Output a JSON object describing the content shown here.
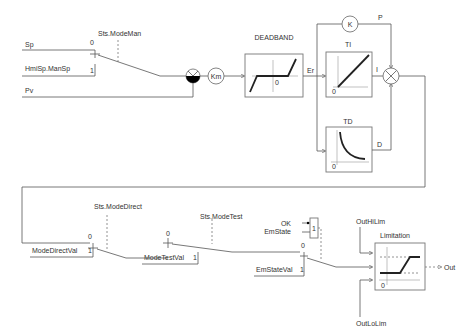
{
  "diagram": {
    "type": "PID controller block diagram",
    "inputs": {
      "sp": "Sp",
      "hmi_man_sp": "HmiSp.ManSp",
      "pv": "Pv"
    },
    "switches": {
      "mode_man": {
        "label": "Sts.ModeMan",
        "pos0": "0",
        "pos1": "1"
      },
      "mode_direct": {
        "label": "Sts.ModeDirect",
        "pos0": "0",
        "pos1": "1",
        "input1": "ModeDirectVal"
      },
      "mode_test": {
        "label": "Sts.ModeTest",
        "pos0": "0",
        "pos1": "1",
        "input1": "ModeTestVal"
      },
      "em_state": {
        "pos0": "0",
        "pos1": "1",
        "input1": "EmStateVal"
      }
    },
    "em_logic": {
      "ok": "OK",
      "em_state": "EmState",
      "value": "1"
    },
    "gain": {
      "label": "Km"
    },
    "deadband": {
      "title": "DEADBAND",
      "zero": "0",
      "output": "Er"
    },
    "proportional": {
      "symbol": "K",
      "output": "P"
    },
    "integral": {
      "title": "TI",
      "zero": "0",
      "output": "I"
    },
    "derivative": {
      "title": "TD",
      "zero": "0",
      "output": "D"
    },
    "limitation": {
      "title": "Limitation",
      "hi": "OutHiLim",
      "lo": "OutLoLim",
      "zero": "0",
      "output": "Out"
    }
  }
}
